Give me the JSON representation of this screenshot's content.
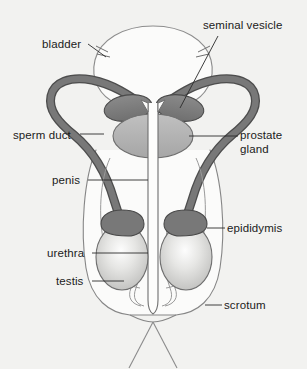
{
  "figure": {
    "background_color": "#f2f2f0"
  },
  "labels": [
    {
      "id": "bladder",
      "text": "bladder"
    },
    {
      "id": "seminal_vesicle",
      "text": "seminal vesicle"
    },
    {
      "id": "sperm_duct",
      "text": "sperm duct"
    },
    {
      "id": "prostate_gland",
      "text": "prostate gland"
    },
    {
      "id": "penis",
      "text": "penis"
    },
    {
      "id": "epididymis",
      "text": "epididymis"
    },
    {
      "id": "urethra",
      "text": "urethra"
    },
    {
      "id": "testis",
      "text": "testis"
    },
    {
      "id": "scrotum",
      "text": "scrotum"
    }
  ],
  "parts": {
    "bladder": {
      "name": "bladder",
      "fill": "#fbfbfa",
      "stroke": "#8d8d8d"
    },
    "seminal_vesicle": {
      "name": "seminal vesicle",
      "fill": "#7f7f7f",
      "stroke": "#4a4a4a"
    },
    "prostate_gland": {
      "name": "prostate gland",
      "fill": "#b4b4b4",
      "stroke": "#6e6e6e"
    },
    "sperm_duct": {
      "name": "sperm duct",
      "fill": "#757575",
      "stroke": "#4d4d4d"
    },
    "epididymis": {
      "name": "epididymis",
      "fill": "#787878",
      "stroke": "#4a4a4a"
    },
    "testis": {
      "name": "testis",
      "fill": "#d8d8d6",
      "stroke": "#6e6e6e"
    },
    "scrotum": {
      "name": "scrotum",
      "fill": "#fbfbfa",
      "stroke": "#77777 7"
    },
    "urethra": {
      "name": "urethra",
      "fill": "#fdfdfc",
      "stroke": "#6f6f6f"
    },
    "penis": {
      "name": "penis",
      "fill": "none",
      "stroke": "#8b8b8b"
    }
  },
  "colors": {
    "leader_line": "#2a2a2a",
    "text": "#1b1b1b",
    "background": "#f2f2f0"
  }
}
